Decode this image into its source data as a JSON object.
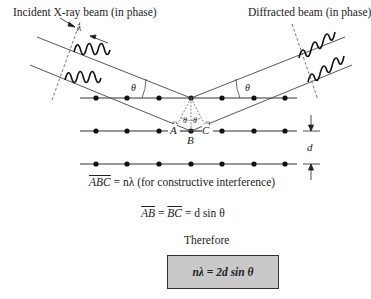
{
  "labels": {
    "incident": "Incident X-ray beam (in phase)",
    "diffracted": "Diffracted beam (in phase)",
    "lambda": "λ",
    "theta_left": "θ",
    "theta_right": "θ",
    "theta_in_left": "θ",
    "theta_in_right": "θ",
    "A": "A",
    "B": "B",
    "C": "C",
    "d": "d"
  },
  "equations": {
    "eq1_lhs": "ABC",
    "eq1_rhs": " = nλ (for constructive interference)",
    "eq2_ab": "AB",
    "eq2_mid": " = ",
    "eq2_bc": "BC",
    "eq2_rhs": " = d sin θ",
    "therefore": "Therefore",
    "result": "nλ = 2d sin θ"
  },
  "colors": {
    "line": "#333333",
    "atom": "#111111",
    "box_fill": "#c9c9c9"
  }
}
